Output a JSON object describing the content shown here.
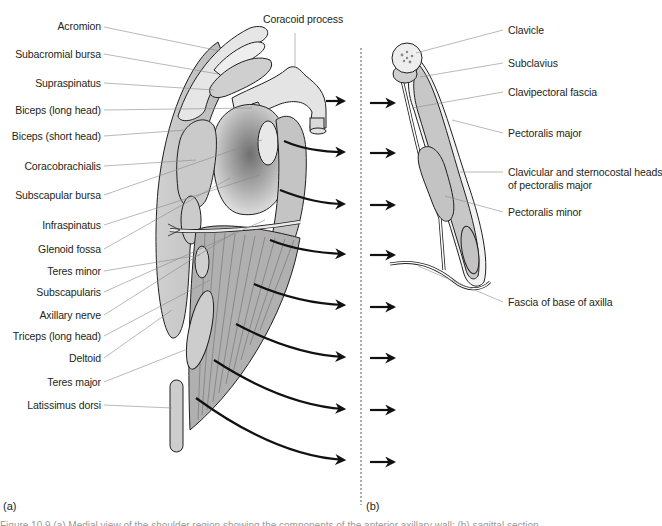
{
  "figure": {
    "panel_a": {
      "tag": "(a)",
      "labels_left": [
        {
          "text": "Acromion",
          "y": 26
        },
        {
          "text": "Subacromial bursa",
          "y": 54
        },
        {
          "text": "Supraspinatus",
          "y": 83
        },
        {
          "text": "Biceps (long head)",
          "y": 110
        },
        {
          "text": "Biceps (short head)",
          "y": 136
        },
        {
          "text": "Coracobrachialis",
          "y": 166
        },
        {
          "text": "Subscapular bursa",
          "y": 195
        },
        {
          "text": "Infraspinatus",
          "y": 225
        },
        {
          "text": "Glenoid fossa",
          "y": 249
        },
        {
          "text": "Teres minor",
          "y": 271
        },
        {
          "text": "Subscapularis",
          "y": 292
        },
        {
          "text": "Axillary nerve",
          "y": 315
        },
        {
          "text": "Triceps (long head)",
          "y": 336
        },
        {
          "text": "Deltoid",
          "y": 358
        },
        {
          "text": "Teres major",
          "y": 382
        },
        {
          "text": "Latissimus dorsi",
          "y": 405
        }
      ],
      "label_top": "Coracoid process"
    },
    "panel_b": {
      "tag": "(b)",
      "labels_right": [
        {
          "text": "Clavicle",
          "y": 30
        },
        {
          "text": "Subclavius",
          "y": 63
        },
        {
          "text": "Clavipectoral fascia",
          "y": 92
        },
        {
          "text": "Pectoralis major",
          "y": 133
        },
        {
          "text": "Clavicular and sternocostal heads",
          "y": 172
        },
        {
          "text": "of pectoralis major",
          "y": 185
        },
        {
          "text": "Pectoralis minor",
          "y": 212
        },
        {
          "text": "Fascia of base of axilla",
          "y": 302
        }
      ]
    },
    "caption_partial": "Figure 10.9 (a) Medial view of the shoulder region showing the components of the anterior axillary wall; (b) sagittal section"
  },
  "colors": {
    "ink": "#231f20",
    "leader": "#8a8a8a",
    "muscle_fill": "#c9c9c9",
    "muscle_dark": "#9d9d9d",
    "bone_fill": "#e4e4e4",
    "arrow": "#111111"
  }
}
